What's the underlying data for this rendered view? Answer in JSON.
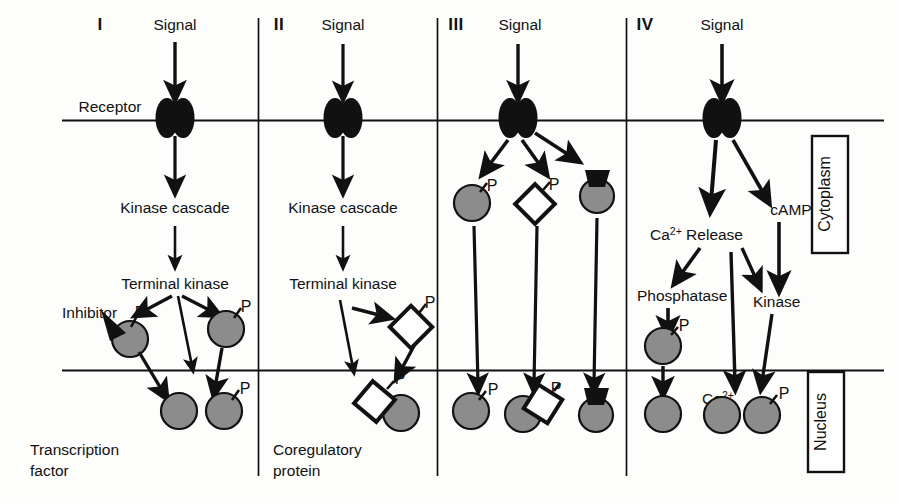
{
  "figure": {
    "type": "biological-pathway-diagram",
    "background": "#fdfdfc",
    "ink": "#111111",
    "protein_fill": "#8c8c8c",
    "membrane_label_top": "Receptor",
    "compartments": [
      {
        "name": "cytoplasm",
        "label": "Cytoplasm"
      },
      {
        "name": "nucleus",
        "label": "Nucleus"
      }
    ],
    "panels": [
      {
        "numeral": "I",
        "signal_label": "Signal",
        "steps": [
          "Kinase cascade",
          "Terminal kinase"
        ],
        "extra_labels": [
          "Inhibitor"
        ],
        "outcome_label": "Transcription\nfactor",
        "outcome_line1": "Transcription",
        "outcome_line2": "factor",
        "phospho_marks": [
          "P",
          "P",
          "P"
        ]
      },
      {
        "numeral": "II",
        "signal_label": "Signal",
        "steps": [
          "Kinase cascade",
          "Terminal kinase"
        ],
        "extra_labels": [],
        "outcome_line1": "Coregulatory",
        "outcome_line2": "protein",
        "phospho_marks": [
          "P",
          "P"
        ]
      },
      {
        "numeral": "III",
        "signal_label": "Signal",
        "steps": [],
        "extra_labels": [],
        "outcome_line1": "",
        "outcome_line2": "",
        "phospho_marks": [
          "P",
          "P",
          "P",
          "P"
        ]
      },
      {
        "numeral": "IV",
        "signal_label": "Signal",
        "steps": [
          "Ca2+ Release",
          "cAMP",
          "Phosphatase",
          "Kinase"
        ],
        "ca_release_prefix": "Ca",
        "ca_release_sup": "2+",
        "ca_release_suffix": " Release",
        "camp_label": "cAMP",
        "phosphatase_label": "Phosphatase",
        "kinase_label": "Kinase",
        "nucleus_ca_prefix": "Ca",
        "nucleus_ca_sup": "2+",
        "phospho_marks": [
          "P",
          "P"
        ]
      }
    ]
  }
}
